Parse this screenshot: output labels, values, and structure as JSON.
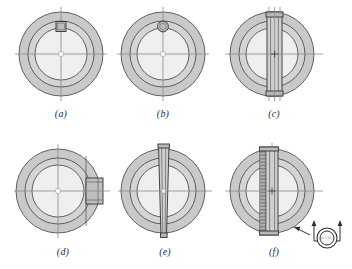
{
  "figure": {
    "type": "engineering-drawing",
    "background_color": "#ffffff",
    "line_color": "#3a3a3a",
    "centerline_color": "#8c8c8c",
    "outer_ring_fill": "#c9c9c9",
    "inner_ring_fill": "#d6d6d6",
    "bore_fill": "#f2f2f2",
    "key_fill": "#bdbdbd",
    "strip_fill": "#cfcfcf",
    "panels": [
      {
        "id": "a",
        "label": "(a)",
        "variant": "square-key",
        "detail_name": "square key at top of bore",
        "key_shape": "square",
        "key_size": 9
      },
      {
        "id": "b",
        "label": "(b)",
        "variant": "round-key",
        "detail_name": "round pin key at top of bore",
        "key_shape": "circle",
        "key_size": 9
      },
      {
        "id": "c",
        "label": "(c)",
        "variant": "split-hub-vertical-clamp",
        "detail_name": "vertical clamped split hub with end bosses",
        "key_shape": "vertical-bar",
        "key_size": 16
      },
      {
        "id": "d",
        "label": "(d)",
        "variant": "side-lug-clamp",
        "detail_name": "side clamping lug projecting at right",
        "key_shape": "side-lug",
        "key_size": 16
      },
      {
        "id": "e",
        "label": "(e)",
        "variant": "tapered-through-bar",
        "detail_name": "tapered through bar extending past hub",
        "key_shape": "tapered-bar",
        "key_size": 14
      },
      {
        "id": "f",
        "label": "(f)",
        "variant": "serrated-clamp-bar",
        "detail_name": "serrated clamp bar with section view indicator",
        "key_shape": "serrated-bar",
        "key_size": 16
      }
    ],
    "inset": {
      "name": "section-view-indicator",
      "description": "small ring with bracket and two upward view arrows",
      "arrow_count": 2,
      "arrow_direction": "up",
      "pointer": "arrow pointing up-left toward panel f"
    },
    "geometry": {
      "outer_radius": 42,
      "mid_radius": 33,
      "inner_radius": 26,
      "bore_radius": 3,
      "centerline_overhang": 8
    }
  }
}
